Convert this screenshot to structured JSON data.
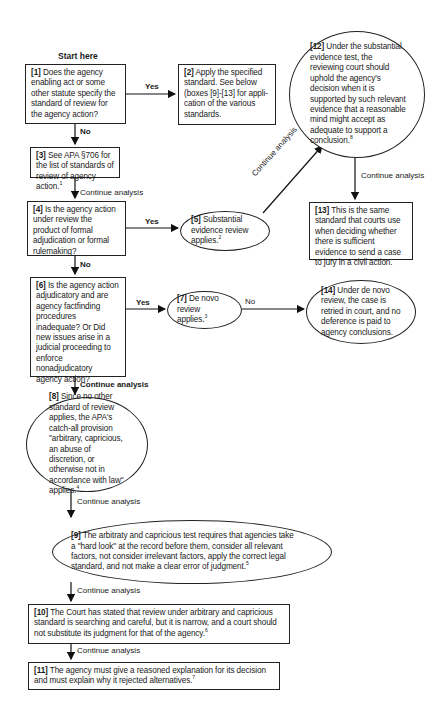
{
  "diagram": {
    "start_label": "Start here",
    "nodes": [
      {
        "id": "1",
        "shape": "rectangle",
        "number": "[1]",
        "text": "Does the agency enabling act or some other statute specify the standard of review for the agency action?",
        "footnote": ""
      },
      {
        "id": "2",
        "shape": "rectangle",
        "number": "[2]",
        "text": "Apply the specified standard. See below (boxes [9]-[13] for appli-cation of the various standards.",
        "footnote": ""
      },
      {
        "id": "3",
        "shape": "rectangle",
        "number": "[3]",
        "text": "See APA §706 for the list of standards of review of agency action.",
        "footnote": "1"
      },
      {
        "id": "4",
        "shape": "rectangle",
        "number": "[4]",
        "text": "Is the agency action under review the product of formal adjudication or formal rulemaking?",
        "footnote": ""
      },
      {
        "id": "5",
        "shape": "ellipse",
        "number": "[5]",
        "text": "Substantial evidence review applies.",
        "footnote": "2"
      },
      {
        "id": "6",
        "shape": "rectangle",
        "number": "[6]",
        "text": "Is the agency action adjudicatory and are agency factfinding procedures inadequate? Or Did new issues arise in a judicial proceeding to enforce nonadjudicatory agency action?",
        "footnote": ""
      },
      {
        "id": "7",
        "shape": "ellipse",
        "number": "[7]",
        "text": "De novo review applies.",
        "footnote": "3"
      },
      {
        "id": "8",
        "shape": "ellipse",
        "number": "[8]",
        "text": "Since no other standard of review applies, the APA's catch-all provision \"arbitrary, capricious, an abuse of discretion, or otherwise not in accordance with law\" applies.",
        "footnote": "4"
      },
      {
        "id": "9",
        "shape": "ellipse",
        "number": "[9]",
        "text": "The arbitraty and capricious test requires that agencies take a \"hard look\" at the record before them, consider all relevant factors, not consider irrelevant factors, apply the correct legal standard, and not make a clear error of judgment.",
        "footnote": "5"
      },
      {
        "id": "10",
        "shape": "rectangle",
        "number": "[10]",
        "text": "The Court has stated that review under arbitrary and capricious standard is searching and careful, but it is narrow, and a court should not substitute its judgment for that of the agency.",
        "footnote": "6"
      },
      {
        "id": "11",
        "shape": "rectangle",
        "number": "[11]",
        "text": "The agency must give a reasoned explanation for its decision and must explain why it rejected alternatives.",
        "footnote": "7"
      },
      {
        "id": "12",
        "shape": "ellipse",
        "number": "[12]",
        "text": "Under the substantial evidence test, the reviewing court should uphold the agency's decision when it is supported by such relevant evidence that a reasonable mind might accept as adequate to support a conclusion.",
        "footnote": "8"
      },
      {
        "id": "13",
        "shape": "rectangle",
        "number": "[13]",
        "text": "This is the same standard that courts use when deciding whether there is sufficient evidence to send a case to jury in a civil action.",
        "footnote": ""
      },
      {
        "id": "14",
        "shape": "ellipse",
        "number": "[14]",
        "text": "Under de novo review, the case is retried in court, and no deference is paid to agency conclusions.",
        "footnote": ""
      }
    ],
    "edges": [
      {
        "from": "1",
        "to": "2",
        "label": "Yes"
      },
      {
        "from": "1",
        "to": "3",
        "label": "No"
      },
      {
        "from": "3",
        "to": "4",
        "label": "Continue analysis"
      },
      {
        "from": "4",
        "to": "5",
        "label": "Yes"
      },
      {
        "from": "4",
        "to": "6",
        "label": "No"
      },
      {
        "from": "5",
        "to": "12",
        "label": "Continue analysis"
      },
      {
        "from": "12",
        "to": "13",
        "label": "Continue analysis"
      },
      {
        "from": "6",
        "to": "7",
        "label": "Yes"
      },
      {
        "from": "6",
        "to": "8",
        "label": "No"
      },
      {
        "from": "7",
        "to": "14",
        "label": "Continue analysis"
      },
      {
        "from": "8",
        "to": "9",
        "label": "Continue analysis"
      },
      {
        "from": "9",
        "to": "10",
        "label": "Continue analysis"
      },
      {
        "from": "10",
        "to": "11",
        "label": "Continue analysis"
      }
    ]
  }
}
